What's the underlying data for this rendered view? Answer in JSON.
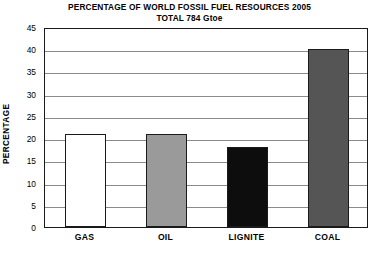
{
  "chart_data": {
    "type": "bar",
    "title": "PERCENTAGE OF WORLD FOSSIL FUEL RESOURCES 2005",
    "subtitle": "TOTAL 784 Gtoe",
    "xlabel": "",
    "ylabel": "PERCENTAGE",
    "categories": [
      "GAS",
      "OIL",
      "LIGNITE",
      "COAL"
    ],
    "values": [
      21,
      21,
      18,
      40
    ],
    "bar_colors": [
      "#ffffff",
      "#9a9a9a",
      "#0d0d0d",
      "#555555"
    ],
    "bar_edge_color": "#1a1a1a",
    "ylim": [
      0,
      45
    ],
    "ytick_values": [
      0,
      5,
      10,
      15,
      20,
      25,
      30,
      35,
      40,
      45
    ],
    "ytick_labels": [
      "0",
      "5",
      "10",
      "15",
      "20",
      "25",
      "30",
      "35",
      "40",
      "45"
    ],
    "grid": true,
    "grid_color": "#8a8a8a",
    "legend": false,
    "legend_position": "none"
  }
}
